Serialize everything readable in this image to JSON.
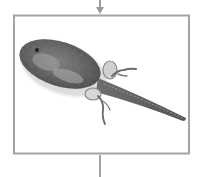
{
  "diagram": {
    "stage_image_alt": "Tadpole developing legs",
    "colors": {
      "frame": "#a3a3a3",
      "arrow": "#9a9a9a",
      "background": "#ffffff",
      "body_dark": "#3a3a3a",
      "body_light": "#8c8c8c"
    },
    "connectors": [
      "incoming-arrow-top",
      "outgoing-line-bottom"
    ]
  }
}
